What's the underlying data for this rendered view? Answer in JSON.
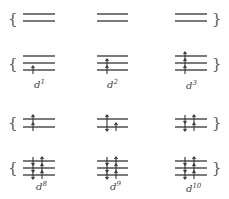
{
  "diagram": {
    "title": "",
    "type": "d-orbital electron configurations (octahedral splitting)",
    "levels": {
      "upper": "eg (2 orbitals)",
      "lower": "t2g (3 orbitals)"
    },
    "colors": {
      "line": "#333333",
      "text": "#444444",
      "background": "#ffffff"
    },
    "columns": [
      {
        "label_base": "d",
        "label_sup": "1",
        "eg": [
          "",
          ""
        ],
        "t2g": [
          "",
          "",
          "up"
        ]
      },
      {
        "label_base": "d",
        "label_sup": "2",
        "eg": [
          "",
          ""
        ],
        "t2g": [
          "",
          "up",
          "up"
        ]
      },
      {
        "label_base": "d",
        "label_sup": "3",
        "eg": [
          "",
          ""
        ],
        "t2g": [
          "up",
          "up",
          "up"
        ]
      }
    ],
    "columns_bottom": [
      {
        "label_base": "d",
        "label_sup": "8",
        "eg": [
          "up",
          "up"
        ],
        "t2g": [
          "pair",
          "pair",
          "pair"
        ]
      },
      {
        "label_base": "d",
        "label_sup": "9",
        "eg": [
          "up",
          "pair"
        ],
        "t2g": [
          "pair",
          "pair",
          "pair"
        ]
      },
      {
        "label_base": "d",
        "label_sup": "10",
        "eg": [
          "pair",
          "pair"
        ],
        "t2g": [
          "pair",
          "pair",
          "pair"
        ]
      }
    ],
    "braces": {
      "left": "{",
      "right": "}"
    }
  }
}
